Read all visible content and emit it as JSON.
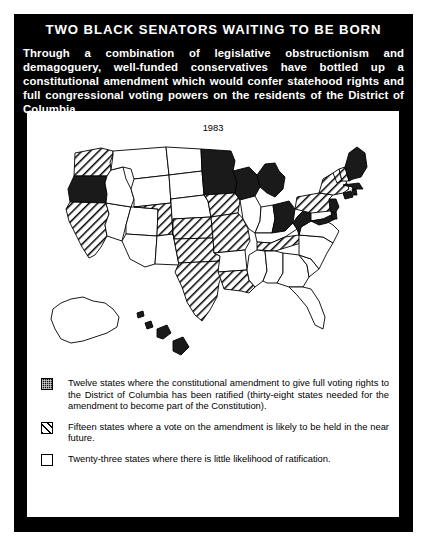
{
  "poster": {
    "title": "TWO BLACK SENATORS WAITING TO BE BORN",
    "intro": "Through a combination of legislative obstructionism and demagoguery, well-funded conservatives have bottled up a constitutional amendment which would confer statehood rights and full congressional voting powers on the residents of the District of Columbia.",
    "year": "1983"
  },
  "legend": {
    "items": [
      {
        "swatch": "solid-black-swatch",
        "text": "Twelve states where the constitutional amendment to give full voting rights to the District of Columbia has been ratified (thirty-eight states needed for the amendment to become part of the Constitution)."
      },
      {
        "swatch": "diagonal-hatch-swatch",
        "text": "Fifteen states where a vote on the amendment is likely to be held in the near future."
      },
      {
        "swatch": "empty-white-swatch",
        "text": "Twenty-three states where there is little likelihood of ratification."
      }
    ]
  },
  "colors": {
    "frame": "#000000",
    "panel": "#ffffff",
    "ratified": "#1a1a1a",
    "pending": "#ffffff",
    "unlikely": "#ffffff",
    "outline": "#000000"
  },
  "chart_data": {
    "type": "map",
    "title": "TWO BLACK SENATORS WAITING TO BE BORN",
    "subtitle": "1983",
    "categories": [
      "ratified",
      "pending",
      "unlikely"
    ],
    "counts": {
      "ratified": 12,
      "pending": 15,
      "unlikely": 23
    },
    "legend_position": "below-map",
    "states": [
      {
        "code": "WA",
        "name": "Washington",
        "status": "pending"
      },
      {
        "code": "OR",
        "name": "Oregon",
        "status": "ratified"
      },
      {
        "code": "CA",
        "name": "California",
        "status": "pending"
      },
      {
        "code": "NV",
        "name": "Nevada",
        "status": "unlikely"
      },
      {
        "code": "ID",
        "name": "Idaho",
        "status": "unlikely"
      },
      {
        "code": "MT",
        "name": "Montana",
        "status": "unlikely"
      },
      {
        "code": "WY",
        "name": "Wyoming",
        "status": "unlikely"
      },
      {
        "code": "UT",
        "name": "Utah",
        "status": "unlikely"
      },
      {
        "code": "AZ",
        "name": "Arizona",
        "status": "unlikely"
      },
      {
        "code": "CO",
        "name": "Colorado",
        "status": "pending"
      },
      {
        "code": "NM",
        "name": "New Mexico",
        "status": "unlikely"
      },
      {
        "code": "ND",
        "name": "North Dakota",
        "status": "unlikely"
      },
      {
        "code": "SD",
        "name": "South Dakota",
        "status": "unlikely"
      },
      {
        "code": "NE",
        "name": "Nebraska",
        "status": "unlikely"
      },
      {
        "code": "KS",
        "name": "Kansas",
        "status": "pending"
      },
      {
        "code": "OK",
        "name": "Oklahoma",
        "status": "pending"
      },
      {
        "code": "TX",
        "name": "Texas",
        "status": "pending"
      },
      {
        "code": "MN",
        "name": "Minnesota",
        "status": "ratified"
      },
      {
        "code": "IA",
        "name": "Iowa",
        "status": "pending"
      },
      {
        "code": "MO",
        "name": "Missouri",
        "status": "pending"
      },
      {
        "code": "AR",
        "name": "Arkansas",
        "status": "unlikely"
      },
      {
        "code": "LA",
        "name": "Louisiana",
        "status": "pending"
      },
      {
        "code": "WI",
        "name": "Wisconsin",
        "status": "ratified"
      },
      {
        "code": "IL",
        "name": "Illinois",
        "status": "unlikely"
      },
      {
        "code": "MI",
        "name": "Michigan",
        "status": "ratified"
      },
      {
        "code": "IN",
        "name": "Indiana",
        "status": "unlikely"
      },
      {
        "code": "OH",
        "name": "Ohio",
        "status": "ratified"
      },
      {
        "code": "KY",
        "name": "Kentucky",
        "status": "unlikely"
      },
      {
        "code": "TN",
        "name": "Tennessee",
        "status": "pending"
      },
      {
        "code": "MS",
        "name": "Mississippi",
        "status": "unlikely"
      },
      {
        "code": "AL",
        "name": "Alabama",
        "status": "unlikely"
      },
      {
        "code": "GA",
        "name": "Georgia",
        "status": "unlikely"
      },
      {
        "code": "FL",
        "name": "Florida",
        "status": "unlikely"
      },
      {
        "code": "SC",
        "name": "South Carolina",
        "status": "unlikely"
      },
      {
        "code": "NC",
        "name": "North Carolina",
        "status": "unlikely"
      },
      {
        "code": "VA",
        "name": "Virginia",
        "status": "unlikely"
      },
      {
        "code": "WV",
        "name": "West Virginia",
        "status": "ratified"
      },
      {
        "code": "MD",
        "name": "Maryland",
        "status": "ratified"
      },
      {
        "code": "DE",
        "name": "Delaware",
        "status": "ratified"
      },
      {
        "code": "NJ",
        "name": "New Jersey",
        "status": "ratified"
      },
      {
        "code": "PA",
        "name": "Pennsylvania",
        "status": "pending"
      },
      {
        "code": "NY",
        "name": "New York",
        "status": "pending"
      },
      {
        "code": "CT",
        "name": "Connecticut",
        "status": "ratified"
      },
      {
        "code": "RI",
        "name": "Rhode Island",
        "status": "ratified"
      },
      {
        "code": "MA",
        "name": "Massachusetts",
        "status": "ratified"
      },
      {
        "code": "VT",
        "name": "Vermont",
        "status": "pending"
      },
      {
        "code": "NH",
        "name": "New Hampshire",
        "status": "pending"
      },
      {
        "code": "ME",
        "name": "Maine",
        "status": "ratified"
      },
      {
        "code": "AK",
        "name": "Alaska",
        "status": "unlikely"
      },
      {
        "code": "HI",
        "name": "Hawaii",
        "status": "ratified"
      }
    ]
  }
}
